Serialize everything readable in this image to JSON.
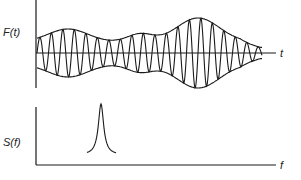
{
  "diagram": {
    "top_panel": {
      "ylabel": "F(t)",
      "xlabel": "t",
      "description": "Amplitude-modulated oscillation with slowly varying envelope"
    },
    "bottom_panel": {
      "ylabel": "S(f)",
      "xlabel": "f",
      "description": "Narrow spectral peak"
    },
    "colors": {
      "ink": "#1a1a1a",
      "background": "#ffffff"
    }
  }
}
